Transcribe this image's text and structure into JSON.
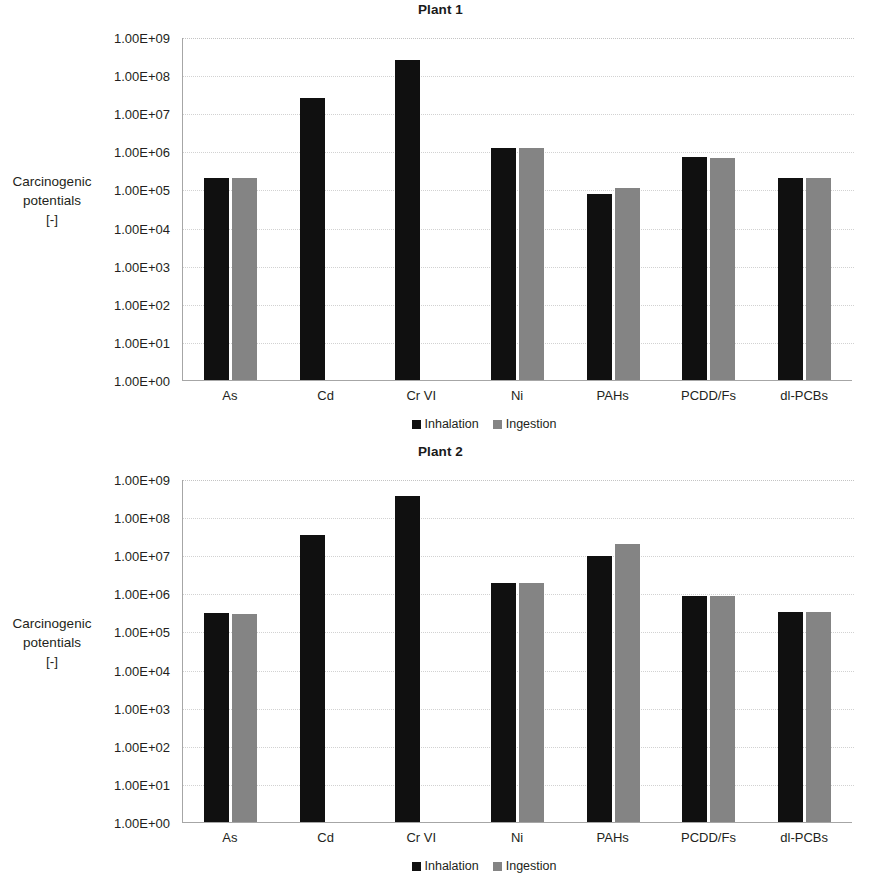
{
  "colors": {
    "inhalation": "#101010",
    "ingestion": "#848484",
    "axis": "#a6a6a6",
    "gridline": "#d2d2d2",
    "text": "#231f20"
  },
  "axis_title": {
    "line1": "Carcinogenic",
    "line2": "potentials",
    "line3": "[-]"
  },
  "legend": {
    "inhalation": "Inhalation",
    "ingestion": "Ingestion"
  },
  "y_ticks": [
    "1.00E+09",
    "1.00E+08",
    "1.00E+07",
    "1.00E+06",
    "1.00E+05",
    "1.00E+04",
    "1.00E+03",
    "1.00E+02",
    "1.00E+01",
    "1.00E+00"
  ],
  "chart_data": [
    {
      "type": "bar",
      "title": "Plant 1",
      "xlabel": "",
      "ylabel": "Carcinogenic potentials [-]",
      "yscale": "log",
      "ylim": [
        1,
        1000000000
      ],
      "grid": true,
      "legend_position": "bottom",
      "categories": [
        "As",
        "Cd",
        "Cr VI",
        "Ni",
        "PAHs",
        "PCDD/Fs",
        "dl-PCBs"
      ],
      "series": [
        {
          "name": "Inhalation",
          "color": "#101010",
          "values": [
            200000,
            25000000,
            250000000,
            1200000,
            75000,
            700000,
            200000
          ]
        },
        {
          "name": "Ingestion",
          "color": "#848484",
          "values": [
            195000,
            null,
            null,
            1200000,
            110000,
            680000,
            195000
          ]
        }
      ]
    },
    {
      "type": "bar",
      "title": "Plant 2",
      "xlabel": "",
      "ylabel": "Carcinogenic potentials [-]",
      "yscale": "log",
      "ylim": [
        1,
        1000000000
      ],
      "grid": true,
      "legend_position": "bottom",
      "categories": [
        "As",
        "Cd",
        "Cr VI",
        "Ni",
        "PAHs",
        "PCDD/Fs",
        "dl-PCBs"
      ],
      "series": [
        {
          "name": "Inhalation",
          "color": "#101010",
          "values": [
            300000,
            35000000,
            350000000,
            1900000,
            9500000,
            850000,
            320000
          ]
        },
        {
          "name": "Ingestion",
          "color": "#848484",
          "values": [
            295000,
            null,
            null,
            1850000,
            20000000,
            830000,
            315000
          ]
        }
      ]
    }
  ]
}
